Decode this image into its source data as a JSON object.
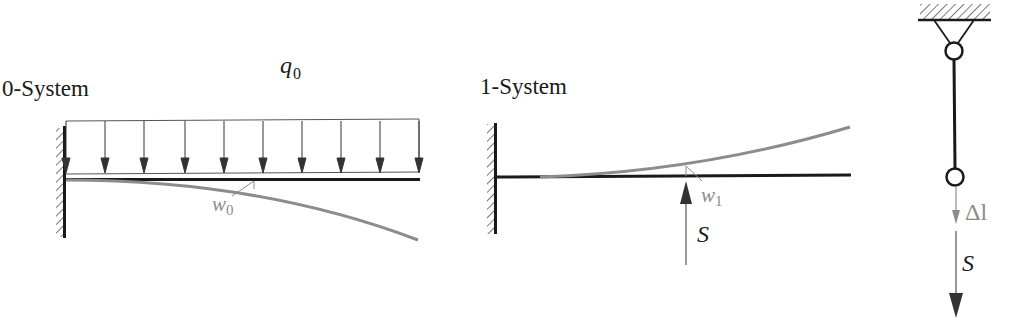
{
  "colors": {
    "beam": "#1a1a1a",
    "deflection": "#8c8c8c",
    "load": "#3a3a3a",
    "label_dark": "#1a1a1a",
    "label_gray": "#8c8c8c"
  },
  "panels": {
    "zero_system": {
      "title": "0-System",
      "load_label": "q",
      "load_sub": "0",
      "deflection_label": "w",
      "deflection_sub": "0"
    },
    "one_system": {
      "title": "1-System",
      "deflection_label": "w",
      "deflection_sub": "1",
      "force_label": "S"
    },
    "rod": {
      "elongation_label": "Δl",
      "force_label": "S"
    }
  }
}
